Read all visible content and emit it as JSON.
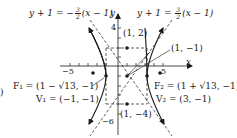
{
  "diagram": {
    "type": "hyperbola-graph",
    "equation_labels": {
      "asymptote_left": {
        "lhs": "y + 1 = −",
        "num": "3",
        "den": "2",
        "rhs": "(x − 1)"
      },
      "asymptote_right": {
        "lhs": "y + 1 = ",
        "num": "3",
        "den": "2",
        "rhs": "(x − 1)"
      }
    },
    "axis_labels": {
      "x": "x",
      "y": "y"
    },
    "tick_labels": {
      "y_top": "4",
      "y_bottom": "−6",
      "x_left": "−5",
      "x_right": "5"
    },
    "points": {
      "top": "(1, 2)",
      "center": "(1, −1)",
      "bottom": "(1, −4)",
      "F1": "F₁ = (1 − √13, −1)",
      "V1": "V₁ = (−1, −1)",
      "F2": "F₂ = (1 + √13, −1)",
      "V2": "V₂ = (3, −1)"
    },
    "edge_fragment": ")",
    "colors": {
      "ink": "#1a1a1a",
      "background": "#ffffff"
    }
  }
}
